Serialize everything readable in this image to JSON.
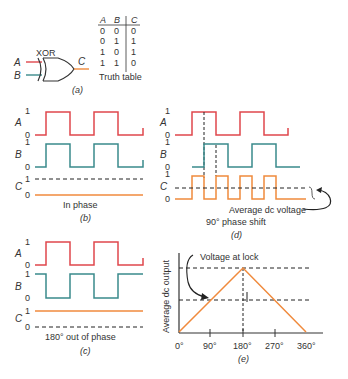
{
  "colors": {
    "A": "#e0474c",
    "B": "#3a8a8c",
    "C": "#f08a3c",
    "ink": "#333333",
    "dash": "#222222"
  },
  "panel_a": {
    "gate_label": "XOR",
    "input_a": "A",
    "input_b": "B",
    "output": "C",
    "caption": "(a)",
    "truth_table": {
      "headers": [
        "A",
        "B",
        "C"
      ],
      "rows": [
        [
          "0",
          "0",
          "0"
        ],
        [
          "0",
          "1",
          "1"
        ],
        [
          "1",
          "0",
          "1"
        ],
        [
          "1",
          "1",
          "0"
        ]
      ],
      "label": "Truth table"
    }
  },
  "panel_b": {
    "signals": [
      "A",
      "B",
      "C"
    ],
    "level_high": "1",
    "level_low": "0",
    "description": "In phase",
    "caption": "(b)"
  },
  "panel_c": {
    "signals": [
      "A",
      "B",
      "C"
    ],
    "level_high": "1",
    "level_low": "0",
    "description": "180° out of phase",
    "caption": "(c)"
  },
  "panel_d": {
    "signals": [
      "A",
      "B",
      "C"
    ],
    "level_high": "1",
    "level_low": "0",
    "annotation": "Average dc voltage",
    "description": "90° phase shift",
    "caption": "(d)"
  },
  "panel_e": {
    "ylabel": "Average dc output",
    "annotation": "Voltage at lock",
    "xticks": [
      "0°",
      "90°",
      "180°",
      "270°",
      "360°"
    ],
    "caption": "(e)"
  }
}
